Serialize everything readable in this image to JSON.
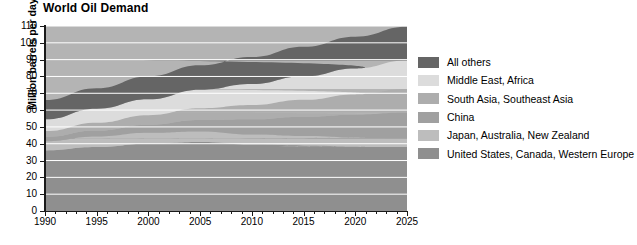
{
  "chart": {
    "title": "World Oil Demand",
    "ylabel": "Million barrels per day",
    "xlabel": ""
  },
  "chart_data": {
    "type": "area",
    "stacked": true,
    "title": "World Oil Demand",
    "xlabel": "",
    "ylabel": "Million barrels per day",
    "xlim": [
      1990,
      2025
    ],
    "ylim": [
      0,
      110
    ],
    "ytick_step": 10,
    "yticks": [
      0,
      10,
      20,
      30,
      40,
      50,
      60,
      70,
      80,
      90,
      100,
      110
    ],
    "xticks": [
      1990,
      1995,
      2000,
      2005,
      2010,
      2015,
      2020,
      2025
    ],
    "x_minor_tick_step": 1,
    "grid": "horizontal-white",
    "legend_position": "right",
    "x": [
      1990,
      1995,
      2000,
      2005,
      2010,
      2015,
      2020,
      2025
    ],
    "series": [
      {
        "name": "United States, Canada, Western Europe",
        "color": "#8f8f8f",
        "values": [
          36.0,
          38.0,
          40.0,
          41.0,
          39.5,
          39.0,
          38.5,
          38.0
        ]
      },
      {
        "name": "Japan, Australia, New Zealand",
        "color": "#bdbdbd",
        "values": [
          5.5,
          6.3,
          6.5,
          6.3,
          6.0,
          5.6,
          5.3,
          5.0
        ]
      },
      {
        "name": "China",
        "color": "#a0a0a0",
        "values": [
          2.5,
          3.5,
          4.8,
          6.8,
          9.0,
          11.5,
          13.5,
          15.5
        ]
      },
      {
        "name": "South Asia, Southeast Asia",
        "color": "#adadad",
        "values": [
          3.5,
          4.7,
          5.7,
          7.0,
          8.5,
          10.0,
          12.0,
          14.0
        ]
      },
      {
        "name": "Middle East, Africa",
        "color": "#dcdcdc",
        "values": [
          7.0,
          8.3,
          9.4,
          11.0,
          12.5,
          14.0,
          15.5,
          17.0
        ]
      },
      {
        "name": "All others",
        "color": "#656565",
        "values": [
          11.5,
          12.2,
          13.6,
          14.5,
          16.0,
          17.5,
          18.8,
          20.0
        ]
      }
    ],
    "totals": [
      66.0,
      73.0,
      80.0,
      86.6,
      91.5,
      97.6,
      103.6,
      109.5
    ],
    "plot_background": "#b4b4b4",
    "gridline_color": "#ffffff"
  },
  "legend": {
    "items": [
      {
        "label": "All others",
        "color": "#656565"
      },
      {
        "label": "Middle East, Africa",
        "color": "#dcdcdc"
      },
      {
        "label": "South Asia, Southeast Asia",
        "color": "#adadad"
      },
      {
        "label": "China",
        "color": "#a0a0a0"
      },
      {
        "label": "Japan, Australia, New Zealand",
        "color": "#bdbdbd"
      },
      {
        "label": "United States, Canada, Western Europe",
        "color": "#8f8f8f"
      }
    ]
  }
}
